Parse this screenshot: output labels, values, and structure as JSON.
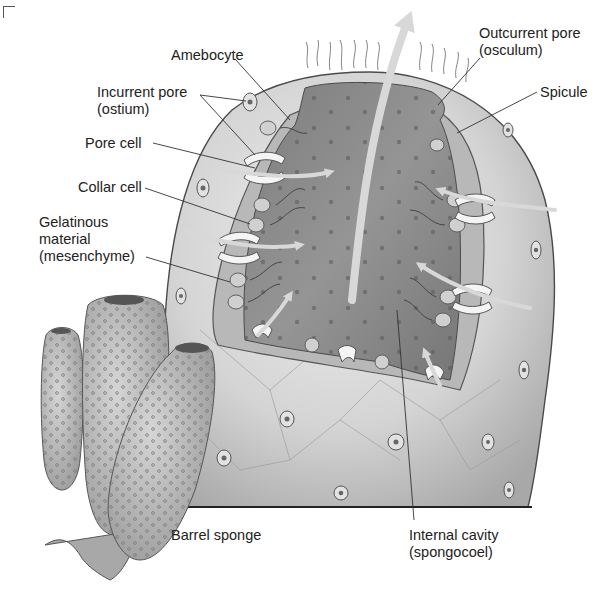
{
  "figure": {
    "colors": {
      "background": "#ffffff",
      "body_wall": "#c9c9c9",
      "body_wall_light": "#e6e6e6",
      "cavity": "#8a8a8a",
      "cavity_dark": "#6e6e6e",
      "cell_layer": "#b4b4b4",
      "pore_cell": "#f2f2f2",
      "arrow": "#d6d6d6",
      "leader_line": "#333333",
      "text": "#222222",
      "ground_line": "#222222"
    }
  },
  "labels": {
    "amebocyte": {
      "lines": [
        "Amebocyte"
      ]
    },
    "incurrent_pore": {
      "lines": [
        "Incurrent pore",
        "(ostium)"
      ]
    },
    "pore_cell": {
      "lines": [
        "Pore cell"
      ]
    },
    "collar_cell": {
      "lines": [
        "Collar cell"
      ]
    },
    "gelatinous_material": {
      "lines": [
        "Gelatinous",
        "material",
        "(mesenchyme)"
      ]
    },
    "outcurrent_pore": {
      "lines": [
        "Outcurrent pore",
        "(osculum)"
      ]
    },
    "spicule": {
      "lines": [
        "Spicule"
      ]
    },
    "barrel_sponge": {
      "lines": [
        "Barrel sponge"
      ]
    },
    "internal_cavity": {
      "lines": [
        "Internal cavity",
        "(spongocoel)"
      ]
    }
  },
  "water_flow": {
    "incoming_arrows": 7,
    "outgoing_arrow": "up through osculum"
  }
}
